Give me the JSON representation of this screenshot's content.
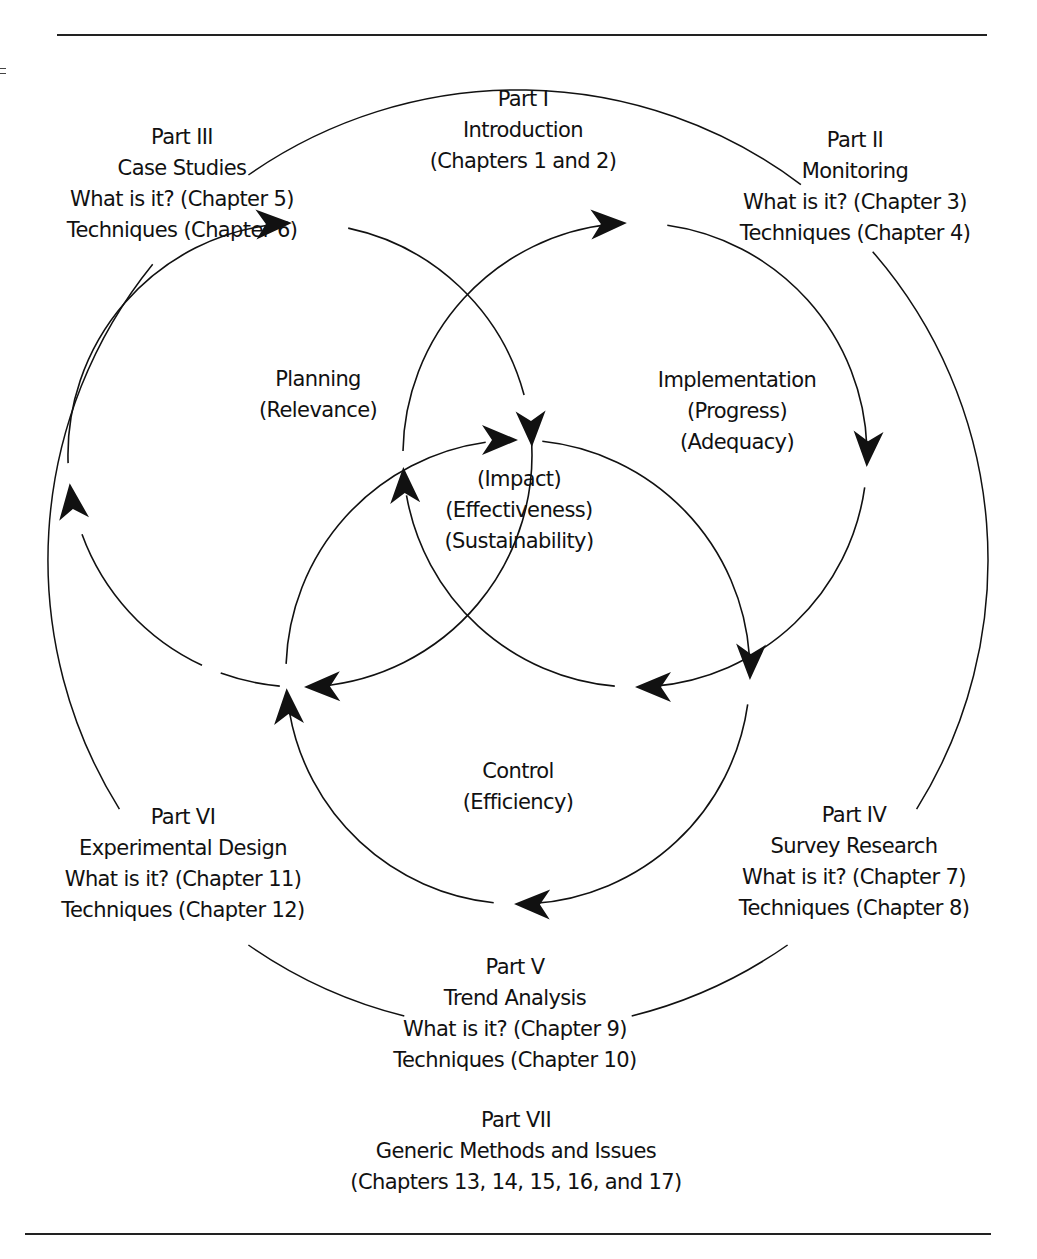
{
  "figure": {
    "parts": {
      "part_i": {
        "title": "Part I",
        "lines": [
          "Introduction",
          "(Chapters 1 and 2)"
        ]
      },
      "part_ii": {
        "title": "Part II",
        "lines": [
          "Monitoring",
          "What is it? (Chapter 3)",
          "Techniques (Chapter 4)"
        ]
      },
      "part_iii": {
        "title": "Part III",
        "lines": [
          "Case Studies",
          "What is it? (Chapter 5)",
          "Techniques (Chapter 6)"
        ]
      },
      "part_iv": {
        "title": "Part IV",
        "lines": [
          "Survey Research",
          "What is it? (Chapter 7)",
          "Techniques (Chapter 8)"
        ]
      },
      "part_v": {
        "title": "Part V",
        "lines": [
          "Trend Analysis",
          "What is it? (Chapter 9)",
          "Techniques (Chapter 10)"
        ]
      },
      "part_vi": {
        "title": "Part VI",
        "lines": [
          "Experimental Design",
          "What is it? (Chapter 11)",
          "Techniques (Chapter 12)"
        ]
      },
      "part_vii": {
        "title": "Part VII",
        "lines": [
          "Generic Methods and Issues",
          "(Chapters 13, 14, 15, 16, and 17)"
        ]
      }
    },
    "cycles": {
      "planning": {
        "title": "Planning",
        "lines": [
          "(Relevance)"
        ]
      },
      "implementation": {
        "title": "Implementation",
        "lines": [
          "(Progress)",
          "(Adequacy)"
        ]
      },
      "control": {
        "title": "Control",
        "lines": [
          "(Efficiency)"
        ]
      },
      "center": {
        "lines": [
          "(Impact)",
          "(Effectiveness)",
          "(Sustainability)"
        ]
      }
    },
    "line_color": "#111111"
  }
}
